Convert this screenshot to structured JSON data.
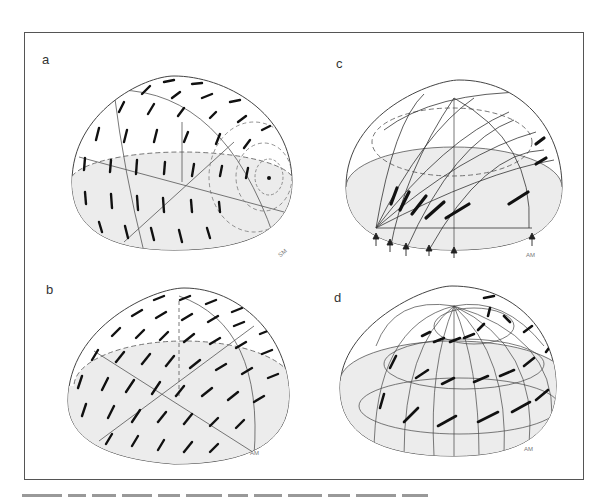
{
  "figure": {
    "panels": [
      {
        "id": "a",
        "label": "a",
        "corner_label": "SM",
        "description": "Hemisphere with short dash pattern, dashed concentric circles around a dot on the right side"
      },
      {
        "id": "b",
        "label": "b",
        "corner_label": "AM",
        "description": "Hemisphere with diagonal dash pattern"
      },
      {
        "id": "c",
        "label": "c",
        "corner_label": "AM",
        "description": "Hemisphere with great circles converging at lower-left point, thick segments, arrows along the bottom"
      },
      {
        "id": "d",
        "label": "d",
        "corner_label": "AM",
        "description": "Hemisphere with meridians converging at the top pole and spiral-like thick dashed bands"
      }
    ],
    "colors": {
      "frame": "#555555",
      "stroke": "#333333",
      "shade": "#ececec",
      "dash": "#111111"
    }
  }
}
